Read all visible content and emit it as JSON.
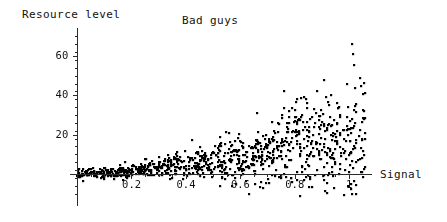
{
  "chart_data": {
    "type": "scatter",
    "title": "Bad guys",
    "xlabel": "Signal",
    "ylabel": "Resource level",
    "xlim": [
      -0.02,
      1.1
    ],
    "ylim": [
      -12,
      75
    ],
    "xticks": [
      0.2,
      0.4,
      0.6,
      0.8,
      1
    ],
    "xtick_labels": [
      "0.2",
      "0.4",
      "0.6",
      "0.8",
      "1"
    ],
    "yticks": [
      20,
      40,
      60
    ],
    "ytick_labels": [
      "20",
      "40",
      "60"
    ],
    "minor_tick_count": 4,
    "grid": false,
    "legend": false,
    "marker": "square-dot",
    "marker_size_px": 2.2,
    "marker_color": "#000000",
    "axis_color": "#2b2b2b",
    "background": "#ffffff",
    "n_points": 1000,
    "model": {
      "x_distribution": "uniform",
      "x_min": 0.0,
      "x_max": 1.06,
      "mean_formula": "18 * x^1.6",
      "spread_formula": "2.0 + 26 * x^1.9",
      "noise": "gaussian-halfskew",
      "seed": 20240517
    },
    "points_summary": [
      {
        "x_bin": "0.0-0.2",
        "y_min": -4,
        "y_max": 26,
        "y_typical": 3
      },
      {
        "x_bin": "0.2-0.4",
        "y_min": -8,
        "y_max": 30,
        "y_typical": 8
      },
      {
        "x_bin": "0.4-0.6",
        "y_min": -10,
        "y_max": 44,
        "y_typical": 13
      },
      {
        "x_bin": "0.6-0.8",
        "y_min": -11,
        "y_max": 63,
        "y_typical": 18
      },
      {
        "x_bin": "0.8-1.06",
        "y_min": -12,
        "y_max": 70,
        "y_typical": 24
      }
    ]
  },
  "geometry": {
    "origin_x_px": 77,
    "origin_y_px": 174,
    "x_unit_px": 272,
    "y_unit_px": 1.965,
    "x_axis_start_px": 70,
    "x_axis_end_px": 372,
    "y_axis_top_px": 28,
    "y_axis_bottom_px": 206
  }
}
